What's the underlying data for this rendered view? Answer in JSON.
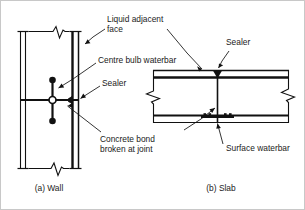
{
  "figure": {
    "ink_color": "#111111",
    "background_color": "#ffffff",
    "border_color": "#c8c8c8"
  },
  "labels": {
    "liquid_adjacent_face_line1": "Liquid adjacent",
    "liquid_adjacent_face_line2": "face",
    "centre_bulb_waterbar": "Centre bulb waterbar",
    "sealer_wall": "Sealer",
    "concrete_bond_line1": "Concrete bond",
    "concrete_bond_line2": "broken at joint",
    "sealer_slab": "Sealer",
    "surface_waterbar": "Surface waterbar"
  },
  "captions": {
    "wall": "(a) Wall",
    "slab": "(b) Slab"
  },
  "diagrams": {
    "wall": {
      "name": "wall-section",
      "faces": {
        "left": "non-liquid face",
        "right": "liquid adjacent face"
      },
      "joint": "horizontal construction joint",
      "waterbar_type": "centre bulb waterbar",
      "break_symbols": [
        "top",
        "bottom"
      ]
    },
    "slab": {
      "name": "slab-section",
      "faces": {
        "top": "liquid adjacent face",
        "bottom": "underside"
      },
      "joint": "vertical construction joint",
      "waterbar_type": "surface waterbar",
      "break_symbols": [
        "left",
        "right"
      ]
    }
  }
}
